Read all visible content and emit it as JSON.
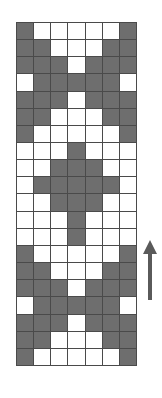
{
  "chart_data": {
    "type": "heatmap",
    "title": "",
    "xlabel": "",
    "ylabel": "",
    "columns": 7,
    "rows": 20,
    "legend": [
      {
        "key": "filled",
        "label": "Contrast colour stitch",
        "color": "#6e6e6e"
      },
      {
        "key": "empty",
        "label": "Main colour stitch",
        "color": "#ffffff"
      }
    ],
    "colors": {
      "filled": "#6e6e6e",
      "empty": "#ffffff",
      "gridline": "#4a4a4a",
      "arrow": "#5a5a5a",
      "background": "#ffffff"
    },
    "cell_values": [
      [
        1,
        0,
        0,
        0,
        0,
        0,
        1
      ],
      [
        1,
        1,
        0,
        0,
        0,
        1,
        1
      ],
      [
        1,
        1,
        1,
        0,
        1,
        1,
        1
      ],
      [
        0,
        1,
        1,
        1,
        1,
        1,
        0
      ],
      [
        1,
        1,
        1,
        0,
        1,
        1,
        1
      ],
      [
        1,
        1,
        0,
        0,
        0,
        1,
        1
      ],
      [
        1,
        0,
        0,
        0,
        0,
        0,
        1
      ],
      [
        0,
        0,
        0,
        1,
        0,
        0,
        0
      ],
      [
        0,
        0,
        1,
        1,
        1,
        0,
        0
      ],
      [
        0,
        1,
        1,
        1,
        1,
        1,
        0
      ],
      [
        0,
        0,
        1,
        1,
        1,
        0,
        0
      ],
      [
        0,
        0,
        0,
        1,
        0,
        0,
        0
      ],
      [
        0,
        0,
        0,
        1,
        0,
        0,
        0
      ],
      [
        1,
        0,
        0,
        0,
        0,
        0,
        1
      ],
      [
        1,
        1,
        0,
        0,
        0,
        1,
        1
      ],
      [
        1,
        1,
        1,
        0,
        1,
        1,
        1
      ],
      [
        0,
        1,
        1,
        1,
        1,
        1,
        0
      ],
      [
        1,
        1,
        1,
        0,
        1,
        1,
        1
      ],
      [
        1,
        1,
        0,
        0,
        0,
        1,
        1
      ],
      [
        1,
        0,
        0,
        0,
        0,
        0,
        1
      ]
    ]
  },
  "annotations": {
    "direction_arrow": {
      "icon": "arrow-up-icon",
      "label": "",
      "direction": "up"
    }
  }
}
